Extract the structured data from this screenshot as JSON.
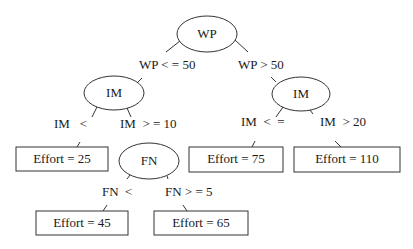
{
  "diagram": {
    "type": "decision-tree",
    "nodes": {
      "root": {
        "label": "WP"
      },
      "left_im": {
        "label": "IM"
      },
      "right_im": {
        "label": "IM"
      },
      "fn": {
        "label": "FN"
      }
    },
    "leaves": {
      "l25": {
        "label": "Effort = 25"
      },
      "l75": {
        "label": "Effort = 75"
      },
      "l110": {
        "label": "Effort = 110"
      },
      "l45": {
        "label": "Effort = 45"
      },
      "l65": {
        "label": "Effort = 65"
      }
    },
    "edges": {
      "wp_le": "WP < = 50",
      "wp_gt": "WP > 50",
      "im_lt": "IM   <",
      "im_ge": "IM  > = 10",
      "im_le": "IM  <  =",
      "im_gt": "IM  > 20",
      "fn_lt": "FN  <",
      "fn_ge": "FN > = 5"
    },
    "colors": {
      "stroke": "#333333",
      "background": "#ffffff"
    }
  }
}
